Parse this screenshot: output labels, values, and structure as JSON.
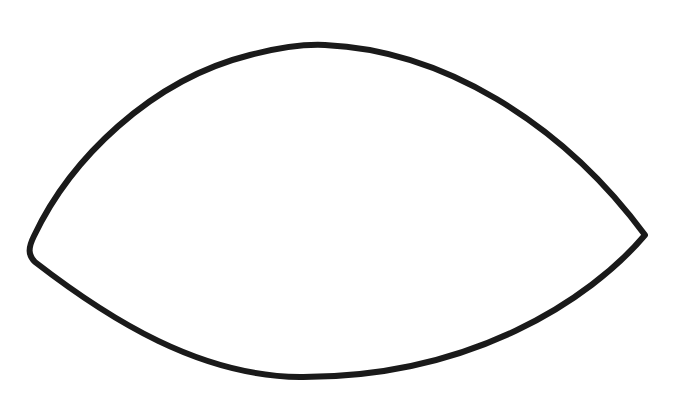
{
  "drawing": {
    "subject": "hand-drawn eye / lens outline",
    "shape_name": "almond-shape",
    "stroke_color": "#1a1a1a",
    "fill_color": "#ffffff",
    "background_color": "#ffffff",
    "stroke_width": 6,
    "points": {
      "left_tip": [
        32,
        258
      ],
      "right_tip": [
        645,
        235
      ],
      "top_peak": [
        320,
        45
      ],
      "bottom_trough": [
        300,
        377
      ]
    }
  }
}
